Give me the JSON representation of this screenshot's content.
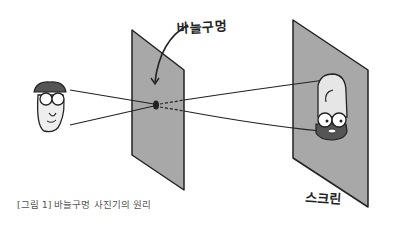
{
  "labels": {
    "pinhole": "바늘구멍",
    "screen": "스크린"
  },
  "caption": "[그림 1] 바늘구멍 사진기의 원리",
  "colors": {
    "plane_fill": "#a8a8a8",
    "outline": "#222222",
    "background": "#ffffff"
  },
  "diagram": {
    "objects": [
      "object-face-upright",
      "pinhole-plane",
      "screen-plane",
      "inverted-image-face"
    ],
    "rays": 2,
    "pinhole_position": [
      156,
      105
    ]
  }
}
